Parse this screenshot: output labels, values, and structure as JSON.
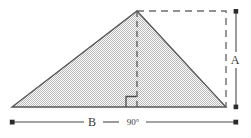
{
  "figure": {
    "type": "geometry-diagram",
    "background_color": "#ffffff",
    "stroke_color": "#4a4a4a",
    "fill_color": "#d4d4d4"
  },
  "labels": {
    "height_label": "A",
    "base_label": "B",
    "angle_label": "90°"
  },
  "shapes": {
    "triangle": {
      "name": "shaded-triangle",
      "fill": "hatched-gray",
      "vertices": [
        {
          "x": 12,
          "y": 107
        },
        {
          "x": 137,
          "y": 11
        },
        {
          "x": 226,
          "y": 107
        }
      ]
    },
    "bounding_box": {
      "name": "dashed-bounding-rectangle",
      "style": "dashed",
      "top_edge": {
        "x1": 137,
        "y1": 11,
        "x2": 226,
        "y2": 11
      },
      "right_edge": {
        "x1": 226,
        "y1": 11,
        "x2": 226,
        "y2": 107
      }
    },
    "altitude": {
      "name": "dashed-altitude-line",
      "style": "dashed",
      "x1": 137,
      "y1": 11,
      "x2": 137,
      "y2": 107
    },
    "right_angle_marker": {
      "name": "right-angle-square",
      "x": 126,
      "y": 96,
      "size": 11
    },
    "height_dimension": {
      "name": "height-dimension-line",
      "x": 236,
      "y1": 11,
      "y2": 107,
      "endpoint_marker": "square-dot"
    },
    "base_dimension": {
      "name": "base-dimension-line",
      "y": 122,
      "x1": 12,
      "x2": 236,
      "endpoint_marker": "square-dot"
    }
  }
}
